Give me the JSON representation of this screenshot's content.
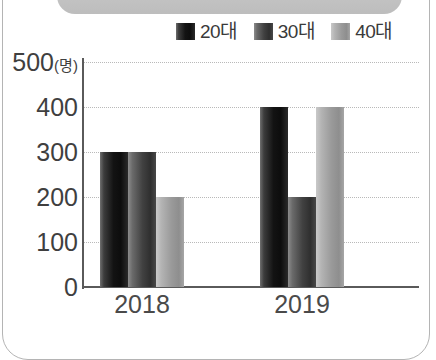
{
  "chart_data": {
    "type": "bar",
    "title": "",
    "subtitle": "",
    "xlabel": "",
    "ylabel": "",
    "y_unit": "(명)",
    "categories": [
      "2018",
      "2019"
    ],
    "series": [
      {
        "name": "20대",
        "values": [
          300,
          400
        ],
        "color": "#131313"
      },
      {
        "name": "30대",
        "values": [
          300,
          200
        ],
        "color": "#414141"
      },
      {
        "name": "40대",
        "values": [
          200,
          400
        ],
        "color": "#9a9a9a"
      }
    ],
    "ylim": [
      0,
      500
    ],
    "y_ticks": [
      "0",
      "100",
      "200",
      "300",
      "400",
      "500"
    ],
    "y_tick_values": [
      0,
      100,
      200,
      300,
      400,
      500
    ],
    "grid": true,
    "grid_style": "dotted",
    "legend_position": "top-right"
  },
  "legend": {
    "items": [
      {
        "label": "20대",
        "swatch": "swatch-20dae"
      },
      {
        "label": "30대",
        "swatch": "swatch-30dae"
      },
      {
        "label": "40대",
        "swatch": "swatch-40dae"
      }
    ]
  },
  "axes": {
    "y_labels": [
      "500",
      "400",
      "300",
      "200",
      "100",
      "0"
    ],
    "y_unit_label": "(명)",
    "x_labels": [
      "2018",
      "2019"
    ]
  },
  "colors": {
    "axis": "#5a5a5a",
    "grid": "#b9b9b9",
    "text": "#3f3f3f",
    "frame": "#b4b4b4",
    "header_band": "#c6c6c6"
  }
}
